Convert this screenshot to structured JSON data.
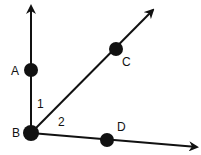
{
  "diagram": {
    "type": "geometry-rays",
    "vertex": {
      "label": "B",
      "x": 31,
      "y": 133,
      "label_x": 12,
      "label_y": 137
    },
    "rays": [
      {
        "id": "ray-ba",
        "through": "A",
        "tip": {
          "x": 31,
          "y": 3
        }
      },
      {
        "id": "ray-bc",
        "through": "C",
        "tip": {
          "x": 155,
          "y": 8
        }
      },
      {
        "id": "ray-bd",
        "through": "D",
        "tip": {
          "x": 200,
          "y": 147
        }
      }
    ],
    "points": [
      {
        "label": "A",
        "x": 31,
        "y": 70,
        "label_x": 11,
        "label_y": 75
      },
      {
        "label": "C",
        "x": 116,
        "y": 49,
        "label_x": 122,
        "label_y": 66
      },
      {
        "label": "D",
        "x": 107,
        "y": 140,
        "label_x": 117,
        "label_y": 131
      }
    ],
    "angles": [
      {
        "label": "1",
        "between": [
          "BA",
          "BC"
        ],
        "x": 37,
        "y": 108
      },
      {
        "label": "2",
        "between": [
          "BC",
          "BD"
        ],
        "x": 58,
        "y": 126
      }
    ],
    "colors": {
      "stroke": "#111111",
      "background": "#ffffff"
    }
  }
}
